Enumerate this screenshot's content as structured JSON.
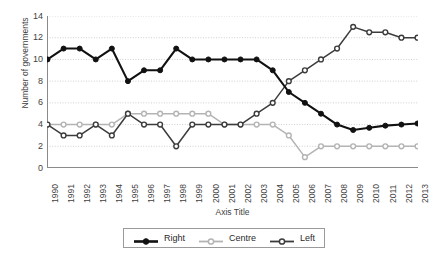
{
  "chart_data": {
    "type": "line",
    "title": "",
    "xlabel": "Axis Title",
    "ylabel": "Number of governments",
    "xlim": [
      1990,
      2013
    ],
    "ylim": [
      0,
      14
    ],
    "ytick_step": 2,
    "grid": true,
    "legend_position": "bottom",
    "categories": [
      "1990",
      "1991",
      "1992",
      "1993",
      "1994",
      "1995",
      "1996",
      "1997",
      "1998",
      "1999",
      "2000",
      "2001",
      "2002",
      "2003",
      "2004",
      "2005",
      "2006",
      "2007",
      "2008",
      "2009",
      "2010",
      "2011",
      "2012",
      "2013"
    ],
    "yticks": [
      "0",
      "2",
      "4",
      "6",
      "8",
      "10",
      "12",
      "14"
    ],
    "series": [
      {
        "name": "Right",
        "color": "#111111",
        "marker": "filled-circle",
        "values": [
          10,
          11,
          11,
          10,
          11,
          8,
          9,
          9,
          11,
          10,
          10,
          10,
          10,
          10,
          9,
          7,
          6,
          5,
          4,
          3.5,
          3.7,
          3.9,
          4,
          4.1
        ]
      },
      {
        "name": "Centre",
        "color": "#b4b4b4",
        "marker": "open-circle",
        "values": [
          4,
          4,
          4,
          4,
          4,
          5,
          5,
          5,
          5,
          5,
          5,
          4,
          4,
          4,
          4,
          3,
          1,
          2,
          2,
          2,
          2,
          2,
          2,
          2
        ]
      },
      {
        "name": "Left",
        "color": "#3c3c3c",
        "marker": "open-circle",
        "values": [
          4,
          3,
          3,
          4,
          3,
          5,
          4,
          4,
          2,
          4,
          4,
          4,
          4,
          5,
          6,
          8,
          9,
          10,
          11,
          13,
          12.5,
          12.5,
          12,
          12
        ]
      }
    ]
  },
  "legend": {
    "items": [
      {
        "label": "Right"
      },
      {
        "label": "Centre"
      },
      {
        "label": "Left"
      }
    ]
  }
}
